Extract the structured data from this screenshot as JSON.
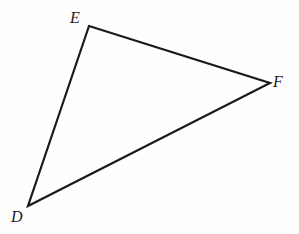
{
  "figure": {
    "background_color": "#fefefe",
    "stroke_color": "#1a1a1a",
    "stroke_width": 2.2,
    "width": 299,
    "height": 234,
    "shape_type": "triangle"
  },
  "vertices": [
    {
      "name": "D",
      "label": "D",
      "x": 28,
      "y": 206,
      "label_x": 11,
      "label_y": 209
    },
    {
      "name": "E",
      "label": "E",
      "x": 89,
      "y": 26,
      "label_x": 70,
      "label_y": 10
    },
    {
      "name": "F",
      "label": "F",
      "x": 270,
      "y": 83,
      "label_x": 273,
      "label_y": 74
    }
  ],
  "edges": [
    {
      "name": "DE",
      "from": "D",
      "to": "E"
    },
    {
      "name": "EF",
      "from": "E",
      "to": "F"
    },
    {
      "name": "FD",
      "from": "F",
      "to": "D"
    }
  ],
  "geometry": {
    "points_attr": "89,26 270,83 28,206"
  }
}
